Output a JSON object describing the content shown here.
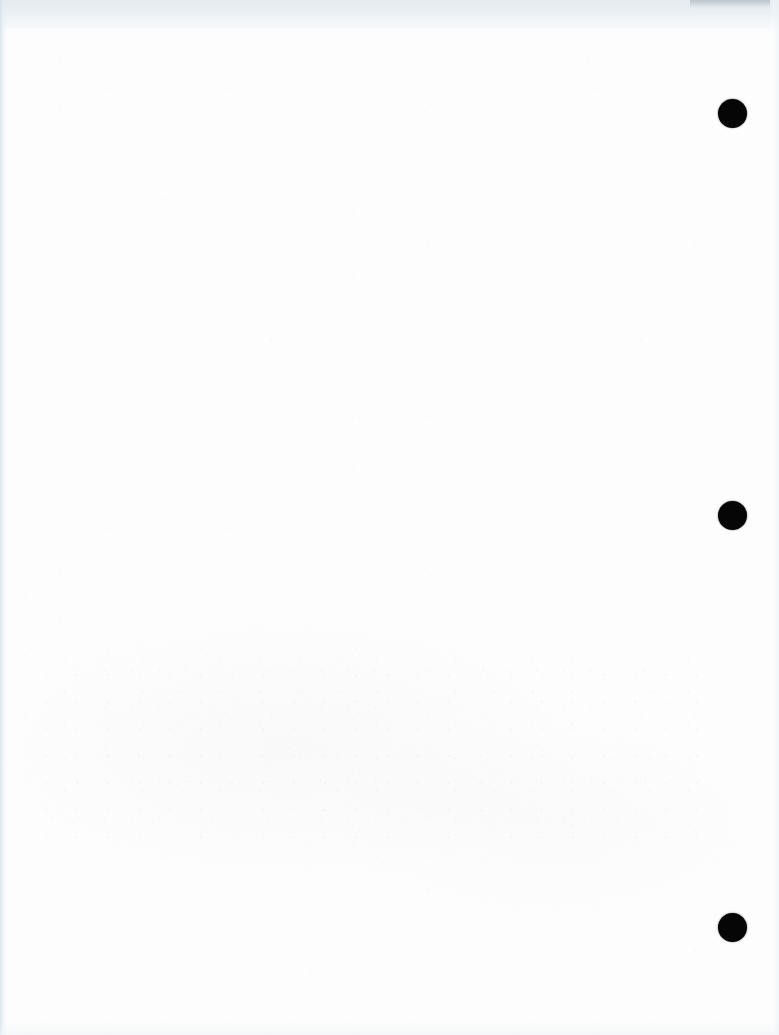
{
  "document": {
    "kind": "scanned-page",
    "page_side": "verso",
    "content_text": "",
    "is_blank": true,
    "width_px": 779,
    "height_px": 1035
  },
  "colors": {
    "paper": "#fdfdfd",
    "top_band": "#e4ebf0",
    "top_band_dark": "#96a3ad",
    "edge_tint": "#cedee8",
    "punch_hole": "#060606",
    "ghost_text": "#7a7e88"
  },
  "scan_artifacts": {
    "top_band": {
      "label": "",
      "height_px": 36
    },
    "left_edge_stripe": {
      "label": "",
      "width_px": 7
    },
    "right_edge_stripe": {
      "label": "",
      "width_px": 10
    },
    "bottom_edge": {
      "label": "",
      "height_px": 14
    }
  },
  "punch_holes": [
    {
      "index": 1,
      "cx": 732,
      "cy": 113,
      "diameter": 29
    },
    {
      "index": 2,
      "cx": 732,
      "cy": 515,
      "diameter": 29
    },
    {
      "index": 3,
      "cx": 732,
      "cy": 927,
      "diameter": 29
    }
  ],
  "bleed_through": {
    "legible": false,
    "note": "",
    "region": {
      "x": 44,
      "y": 648,
      "width": 664,
      "height": 190
    },
    "lines": [
      "               ",
      "                      ",
      "                    ",
      "                        ",
      "            ",
      "               "
    ]
  }
}
